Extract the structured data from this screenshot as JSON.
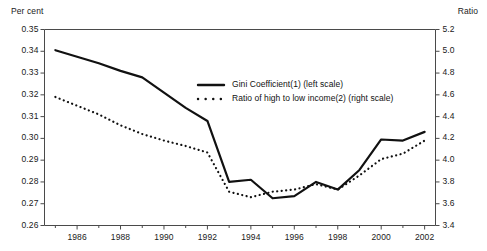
{
  "chart_data": {
    "type": "line",
    "title": "",
    "xlabel": "",
    "ylabel": "Per cent",
    "y2label": "Ratio",
    "grid": false,
    "legend_position": "inside-upper-right",
    "x": [
      1985,
      1986,
      1987,
      1988,
      1989,
      1990,
      1991,
      1992,
      1993,
      1994,
      1995,
      1996,
      1997,
      1998,
      1999,
      2000,
      2001,
      2002
    ],
    "xlim": [
      1984.5,
      2002.5
    ],
    "xticks": [
      1986,
      1988,
      1990,
      1992,
      1994,
      1996,
      1998,
      2000,
      2002
    ],
    "xtick_labels": [
      "1986",
      "1988",
      "1990",
      "1992",
      "1994",
      "1996",
      "1998",
      "2000",
      "2002"
    ],
    "ylim": [
      0.26,
      0.35
    ],
    "yticks": [
      0.26,
      0.27,
      0.28,
      0.29,
      0.3,
      0.31,
      0.32,
      0.33,
      0.34,
      0.35
    ],
    "ytick_labels": [
      "0.26",
      "0.27",
      "0.28",
      "0.29",
      "0.30",
      "0.31",
      "0.32",
      "0.33",
      "0.34",
      "0.35"
    ],
    "y2lim": [
      3.4,
      5.2
    ],
    "y2ticks": [
      3.4,
      3.6,
      3.8,
      4.0,
      4.2,
      4.4,
      4.6,
      4.8,
      5.0,
      5.2
    ],
    "y2tick_labels": [
      "3.4",
      "3.6",
      "3.8",
      "4.0",
      "4.2",
      "4.4",
      "4.6",
      "4.8",
      "5.0",
      "5.2"
    ],
    "series": [
      {
        "name": "Gini Coefficient(1) (left scale)",
        "axis": "left",
        "style": "solid",
        "color": "#111111",
        "values": [
          0.3405,
          0.3375,
          0.3345,
          0.331,
          0.328,
          0.321,
          0.314,
          0.308,
          0.28,
          0.281,
          0.2725,
          0.2735,
          0.28,
          0.2765,
          0.2855,
          0.2995,
          0.299,
          0.303
        ]
      },
      {
        "name": "Ratio of high to low income(2) (right scale)",
        "axis": "right",
        "style": "dotted",
        "color": "#111111",
        "values": [
          4.58,
          4.5,
          4.42,
          4.32,
          4.24,
          4.18,
          4.13,
          4.07,
          3.71,
          3.66,
          3.71,
          3.73,
          3.78,
          3.73,
          3.86,
          4.01,
          4.06,
          4.18
        ]
      }
    ]
  },
  "axes": {
    "left_unit": "Per cent",
    "right_unit": "Ratio"
  },
  "legend": {
    "items": [
      {
        "label": "Gini Coefficient(1) (left scale)",
        "style": "solid"
      },
      {
        "label": "Ratio of high to low income(2) (right scale)",
        "style": "dotted"
      }
    ]
  }
}
